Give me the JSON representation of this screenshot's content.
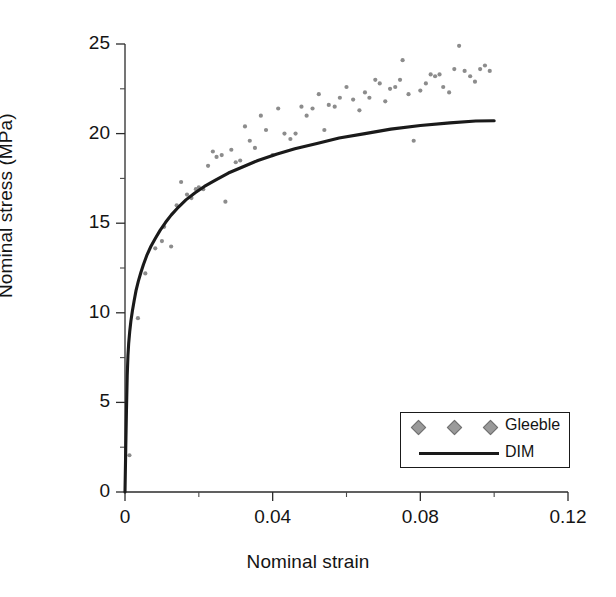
{
  "chart_data": {
    "type": "scatter",
    "title": "",
    "xlabel": "Nominal strain",
    "ylabel": "Nominal stress (MPa)",
    "xlim": [
      0,
      0.12
    ],
    "ylim": [
      0,
      25
    ],
    "xticks": [
      0,
      0.04,
      0.08,
      0.12
    ],
    "xtick_labels": [
      "0",
      "0.04",
      "0.08",
      "0.12"
    ],
    "xminor_step": 0.02,
    "yticks": [
      0,
      5,
      10,
      15,
      20,
      25
    ],
    "ytick_labels": [
      "0",
      "5",
      "10",
      "15",
      "20",
      "25"
    ],
    "yminor_step": 2.5,
    "grid": false,
    "legend_position": "lower-right",
    "series": [
      {
        "name": "Gleeble",
        "type": "scatter",
        "marker": "diamond",
        "color": "#8c8c8c",
        "points": [
          [
            0.0012,
            2.05
          ],
          [
            0.0035,
            9.7
          ],
          [
            0.0055,
            12.2
          ],
          [
            0.0082,
            13.6
          ],
          [
            0.01,
            14.0
          ],
          [
            0.0106,
            14.8
          ],
          [
            0.0125,
            13.7
          ],
          [
            0.014,
            16.0
          ],
          [
            0.0152,
            17.3
          ],
          [
            0.0168,
            16.6
          ],
          [
            0.018,
            16.4
          ],
          [
            0.0192,
            16.9
          ],
          [
            0.02,
            17.0
          ],
          [
            0.0212,
            16.9
          ],
          [
            0.0225,
            18.2
          ],
          [
            0.0238,
            19.0
          ],
          [
            0.0248,
            18.7
          ],
          [
            0.0262,
            18.8
          ],
          [
            0.0272,
            16.2
          ],
          [
            0.0288,
            19.1
          ],
          [
            0.03,
            18.4
          ],
          [
            0.0312,
            18.5
          ],
          [
            0.0325,
            20.4
          ],
          [
            0.0338,
            19.6
          ],
          [
            0.0352,
            19.2
          ],
          [
            0.0368,
            21.0
          ],
          [
            0.0382,
            20.2
          ],
          [
            0.04,
            18.8
          ],
          [
            0.0415,
            21.4
          ],
          [
            0.0432,
            20.0
          ],
          [
            0.0448,
            19.7
          ],
          [
            0.0462,
            20.0
          ],
          [
            0.0478,
            21.5
          ],
          [
            0.0492,
            21.0
          ],
          [
            0.0508,
            21.4
          ],
          [
            0.0525,
            22.2
          ],
          [
            0.054,
            20.2
          ],
          [
            0.0552,
            21.6
          ],
          [
            0.0568,
            21.5
          ],
          [
            0.0582,
            22.0
          ],
          [
            0.06,
            22.6
          ],
          [
            0.0618,
            21.9
          ],
          [
            0.0635,
            21.3
          ],
          [
            0.065,
            22.3
          ],
          [
            0.0662,
            22.0
          ],
          [
            0.0678,
            23.0
          ],
          [
            0.069,
            22.8
          ],
          [
            0.0705,
            21.8
          ],
          [
            0.0718,
            22.5
          ],
          [
            0.0732,
            22.6
          ],
          [
            0.0745,
            23.0
          ],
          [
            0.0752,
            24.1
          ],
          [
            0.0768,
            22.2
          ],
          [
            0.0782,
            19.6
          ],
          [
            0.08,
            22.4
          ],
          [
            0.0815,
            22.8
          ],
          [
            0.0828,
            23.3
          ],
          [
            0.084,
            23.2
          ],
          [
            0.0852,
            23.3
          ],
          [
            0.0862,
            22.6
          ],
          [
            0.0878,
            22.3
          ],
          [
            0.0892,
            23.6
          ],
          [
            0.0905,
            24.9
          ],
          [
            0.092,
            23.5
          ],
          [
            0.0935,
            23.2
          ],
          [
            0.0948,
            22.9
          ],
          [
            0.0962,
            23.6
          ],
          [
            0.0975,
            23.8
          ],
          [
            0.0988,
            23.5
          ]
        ]
      },
      {
        "name": "DIM",
        "type": "line",
        "color": "#1a1a1a",
        "points": [
          [
            0.0,
            0.0
          ],
          [
            0.0002,
            2.4
          ],
          [
            0.0004,
            4.6
          ],
          [
            0.0006,
            6.5
          ],
          [
            0.0008,
            7.6
          ],
          [
            0.001,
            8.3
          ],
          [
            0.0013,
            9.0
          ],
          [
            0.0016,
            9.55
          ],
          [
            0.002,
            10.1
          ],
          [
            0.0025,
            10.7
          ],
          [
            0.003,
            11.25
          ],
          [
            0.0036,
            11.75
          ],
          [
            0.0043,
            12.25
          ],
          [
            0.005,
            12.7
          ],
          [
            0.006,
            13.25
          ],
          [
            0.007,
            13.7
          ],
          [
            0.0082,
            14.15
          ],
          [
            0.0095,
            14.6
          ],
          [
            0.011,
            15.05
          ],
          [
            0.0125,
            15.45
          ],
          [
            0.0145,
            15.9
          ],
          [
            0.0165,
            16.3
          ],
          [
            0.019,
            16.7
          ],
          [
            0.0215,
            17.05
          ],
          [
            0.0245,
            17.4
          ],
          [
            0.028,
            17.8
          ],
          [
            0.032,
            18.15
          ],
          [
            0.036,
            18.5
          ],
          [
            0.041,
            18.85
          ],
          [
            0.046,
            19.15
          ],
          [
            0.052,
            19.45
          ],
          [
            0.058,
            19.75
          ],
          [
            0.065,
            20.0
          ],
          [
            0.072,
            20.25
          ],
          [
            0.08,
            20.45
          ],
          [
            0.088,
            20.6
          ],
          [
            0.095,
            20.7
          ],
          [
            0.1,
            20.72
          ]
        ]
      }
    ]
  },
  "legend": {
    "entries": [
      {
        "label": "Gleeble",
        "marker": "diamond"
      },
      {
        "label": "DIM",
        "marker": "line"
      }
    ]
  }
}
